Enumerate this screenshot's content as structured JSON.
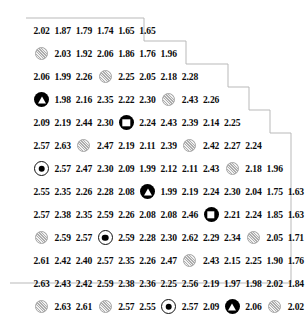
{
  "figure": {
    "kind": "triangular-value-matrix",
    "marker_legend": {
      "gray-disc": "gray textured circle marker",
      "black-triangle": "black circle with white triangle marker",
      "black-square": "black circle with white square marker",
      "bullseye": "white circle with black dot marker"
    },
    "colors": {
      "text": "#0b0b0b",
      "marker_gray": "#c9c9c9",
      "marker_black": "#000000",
      "outline": "#b9b9b9",
      "background": "#ffffff"
    }
  },
  "chart_data": {
    "type": "table",
    "title": "",
    "xlabel": "",
    "ylabel": "",
    "grid": false,
    "legend": "none",
    "note": "Staircase / triangular matrix of numeric values; some cells are replaced by plot markers.",
    "rows": [
      [
        "2.02",
        "1.87",
        "1.79",
        "1.74",
        "1.65",
        "1.65"
      ],
      [
        "gray-disc",
        "2.03",
        "1.92",
        "2.06",
        "1.86",
        "1.76",
        "1.96"
      ],
      [
        "2.06",
        "1.99",
        "2.26",
        "gray-disc",
        "2.25",
        "2.05",
        "2.18",
        "2.28"
      ],
      [
        "black-triangle",
        "1.98",
        "2.16",
        "2.35",
        "2.22",
        "2.30",
        "gray-disc",
        "2.43",
        "2.26"
      ],
      [
        "2.09",
        "2.19",
        "2.44",
        "2.30",
        "black-square",
        "2.24",
        "2.43",
        "2.39",
        "2.14",
        "2.25"
      ],
      [
        "2.57",
        "2.63",
        "gray-disc",
        "2.47",
        "2.19",
        "2.11",
        "2.39",
        "gray-disc",
        "2.42",
        "2.27",
        "2.24"
      ],
      [
        "bullseye",
        "2.57",
        "2.47",
        "2.30",
        "2.09",
        "1.99",
        "2.12",
        "2.11",
        "2.43",
        "gray-disc",
        "2.18",
        "1.96"
      ],
      [
        "2.55",
        "2.35",
        "2.26",
        "2.28",
        "2.08",
        "black-triangle",
        "1.99",
        "2.19",
        "2.24",
        "2.30",
        "2.04",
        "1.75",
        "1.63"
      ],
      [
        "2.57",
        "2.38",
        "2.35",
        "2.59",
        "2.26",
        "2.08",
        "2.08",
        "2.46",
        "black-square",
        "2.21",
        "2.24",
        "1.85",
        "1.63"
      ],
      [
        "gray-disc",
        "2.59",
        "2.57",
        "bullseye",
        "2.59",
        "2.28",
        "2.30",
        "2.62",
        "2.29",
        "2.34",
        "gray-disc",
        "2.05",
        "1.71"
      ],
      [
        "2.61",
        "2.42",
        "2.40",
        "2.57",
        "2.35",
        "2.26",
        "2.47",
        "gray-disc",
        "2.43",
        "2.15",
        "2.25",
        "1.90",
        "1.76"
      ],
      [
        "2.63",
        "2.43",
        "2.42",
        "2.59",
        "2.38",
        "2.36",
        "2.25",
        "2.56",
        "2.19",
        "1.97",
        "1.98",
        "2.02",
        "1.84"
      ],
      [
        "gray-disc",
        "2.63",
        "2.61",
        "gray-disc",
        "2.57",
        "2.55",
        "bullseye",
        "2.57",
        "2.09",
        "black-triangle",
        "2.06",
        "gray-disc",
        "2.02"
      ]
    ]
  }
}
